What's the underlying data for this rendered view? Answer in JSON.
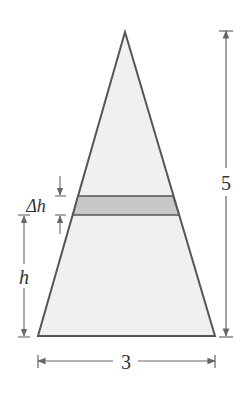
{
  "diagram": {
    "type": "triangle-with-slice",
    "labels": {
      "height_total": "5",
      "base_width": "3",
      "slice_thickness": "Δh",
      "slice_height": "h"
    },
    "colors": {
      "stroke": "#555555",
      "triangle_fill": "#f0f0f0",
      "slice_fill": "#c8c8c8",
      "dimension_line": "#666666"
    }
  }
}
